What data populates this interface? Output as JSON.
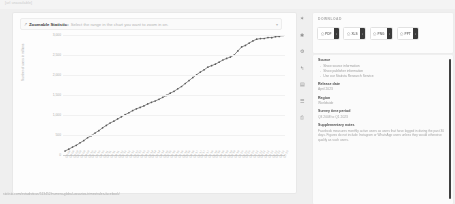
{
  "page": {
    "top_ghost_text": "[url unavailable]",
    "footer_url": "statista.com/estadisticas/513452/numero-global-usuarios-trimestrales-facebook/"
  },
  "zoom_bar": {
    "icon": "zoom-select-icon",
    "strong_label": "Zoomable Statistic:",
    "hint": "Select the range in the chart you want to zoom in on.",
    "caret": "▾"
  },
  "rail": {
    "items": [
      {
        "name": "favorite-icon",
        "glyph": "✶"
      },
      {
        "name": "info-icon",
        "glyph": "✱"
      },
      {
        "name": "settings-gear-icon",
        "glyph": "⚙"
      },
      {
        "name": "share-icon",
        "glyph": "↰"
      },
      {
        "name": "table-view-icon",
        "glyph": "▤"
      },
      {
        "name": "list-view-icon",
        "glyph": "☰"
      },
      {
        "name": "print-icon",
        "glyph": "⎙"
      }
    ]
  },
  "download": {
    "title": "DOWNLOAD",
    "buttons": [
      {
        "label": "PDF",
        "icon": "pdf-file-icon",
        "side_glyph": "↓"
      },
      {
        "label": "XLS",
        "icon": "xls-file-icon",
        "side_glyph": "↓"
      },
      {
        "label": "PNG",
        "icon": "png-file-icon",
        "side_glyph": "↓"
      },
      {
        "label": "PPT",
        "icon": "ppt-file-icon",
        "side_glyph": "↓"
      }
    ]
  },
  "info": {
    "source_heading": "Source",
    "source_links": [
      "Show source information",
      "Show publisher information",
      "Use our Statista Research Service"
    ],
    "arrow_glyph": "→",
    "release_heading": "Release date",
    "release_value": "April 2023",
    "region_heading": "Region",
    "region_value": "Worldwide",
    "survey_heading": "Survey time period",
    "survey_value": "Q3 2008 to Q1 2023",
    "notes_heading": "Supplementary notes",
    "notes_text": "Facebook measures monthly active users as users that have logged in during the past 30 days. Figures do not include Instagram or WhatsApp users unless they would otherwise qualify as such users."
  },
  "chart_data": {
    "type": "line",
    "title": "",
    "xlabel": "",
    "ylabel": "Number of users in millions",
    "ylim": [
      0,
      3000
    ],
    "yticks": [
      0,
      500,
      1000,
      1500,
      2000,
      2500,
      3000
    ],
    "ytick_labels": [
      "0",
      "500",
      "1,000",
      "1,500",
      "2,000",
      "2,500",
      "3,000"
    ],
    "grid": true,
    "legend": "none",
    "marker": "circle",
    "line_color": "#6f6f6f",
    "categories": [
      "Q3 '08",
      "Q4 '08",
      "Q1 '09",
      "Q2 '09",
      "Q3 '09",
      "Q4 '09",
      "Q1 '10",
      "Q2 '10",
      "Q3 '10",
      "Q4 '10",
      "Q1 '11",
      "Q2 '11",
      "Q3 '11",
      "Q4 '11",
      "Q1 '12",
      "Q2 '12",
      "Q3 '12",
      "Q4 '12",
      "Q1 '13",
      "Q2 '13",
      "Q3 '13",
      "Q4 '13",
      "Q1 '14",
      "Q2 '14",
      "Q3 '14",
      "Q4 '14",
      "Q1 '15",
      "Q2 '15",
      "Q3 '15",
      "Q4 '15",
      "Q1 '16",
      "Q2 '16",
      "Q3 '16",
      "Q4 '16",
      "Q1 '17",
      "Q2 '17",
      "Q3 '17",
      "Q4 '17",
      "Q1 '18",
      "Q2 '18",
      "Q3 '18",
      "Q4 '18",
      "Q1 '19",
      "Q2 '19",
      "Q3 '19",
      "Q4 '19",
      "Q1 '20",
      "Q2 '20",
      "Q3 '20",
      "Q4 '20",
      "Q1 '21",
      "Q2 '21",
      "Q3 '21",
      "Q4 '21",
      "Q1 '22",
      "Q2 '22",
      "Q3 '22",
      "Q4 '22",
      "Q1 '23"
    ],
    "values": [
      100,
      145,
      197,
      242,
      305,
      360,
      431,
      482,
      550,
      608,
      680,
      739,
      800,
      845,
      901,
      955,
      1007,
      1056,
      1110,
      1155,
      1189,
      1228,
      1276,
      1317,
      1350,
      1393,
      1441,
      1490,
      1545,
      1591,
      1654,
      1712,
      1788,
      1860,
      1936,
      2006,
      2072,
      2129,
      2196,
      2234,
      2271,
      2320,
      2375,
      2414,
      2449,
      2498,
      2603,
      2701,
      2740,
      2797,
      2853,
      2895,
      2910,
      2912,
      2936,
      2934,
      2958,
      2963,
      2989
    ]
  }
}
